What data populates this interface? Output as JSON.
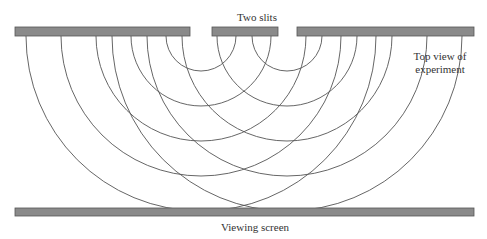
{
  "labels": {
    "slits": "Two slits",
    "top_view_line1": "Top view of",
    "top_view_line2": "experiment",
    "screen": "Viewing screen"
  },
  "colors": {
    "barrier_fill": "#8a8a8a",
    "barrier_stroke": "#555555",
    "wave_stroke": "#555555",
    "text": "#333333"
  },
  "geometry": {
    "barrier": {
      "y": 27,
      "height": 9,
      "segments": [
        [
          15,
          190
        ],
        [
          212,
          278
        ],
        [
          297,
          474
        ]
      ]
    },
    "screen": {
      "x": 15,
      "y": 208,
      "width": 459,
      "height": 8
    },
    "slit_centers": [
      201,
      287
    ],
    "wave_origin_y": 36,
    "wave_radii": [
      35,
      70,
      105,
      140,
      175
    ]
  }
}
